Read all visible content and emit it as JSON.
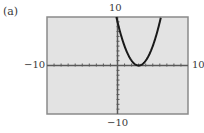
{
  "panel_label": "(a)",
  "window": {
    "xmin_label": "−10",
    "xmax_label": "10",
    "ymin_label": "−10",
    "ymax_label": "10"
  },
  "colors": {
    "screen_bg": "#e3e3e3",
    "frame": "#8a8a8a",
    "axis": "#5a5a5a",
    "curve": "#1a1a1a"
  },
  "chart_data": {
    "type": "line",
    "title": "(a)",
    "xlabel": "",
    "ylabel": "",
    "xlim": [
      -10,
      10
    ],
    "ylim": [
      -10,
      10
    ],
    "xscl": 1,
    "yscl": 1,
    "grid": false,
    "tick_labels": {
      "x": [
        "-10",
        "10"
      ],
      "y": [
        "-10",
        "10"
      ]
    },
    "series": [
      {
        "name": "y = (x - 3)^2",
        "x": [
          -0.16,
          0,
          0.5,
          1,
          1.5,
          2,
          2.5,
          3,
          3.5,
          4,
          4.5,
          5,
          5.5,
          6,
          6.16
        ],
        "values": [
          10,
          9,
          6.25,
          4,
          2.25,
          1,
          0.25,
          0,
          0.25,
          1,
          2.25,
          4,
          6.25,
          9,
          10
        ]
      }
    ]
  }
}
